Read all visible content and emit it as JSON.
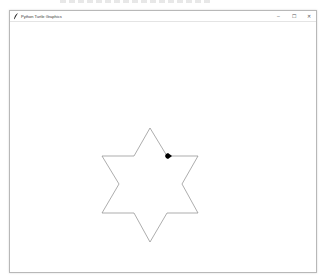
{
  "window": {
    "title": "Python Turtle Graphics",
    "app_icon": "feather-icon",
    "controls": [
      {
        "name": "minimize",
        "glyph": "–"
      },
      {
        "name": "maximize",
        "glyph": "☐"
      },
      {
        "name": "close",
        "glyph": "✕"
      }
    ]
  },
  "drawing": {
    "shape": "six-pointed star",
    "stroke_color": "#8a8a8a",
    "turtle_color": "#000000",
    "turtle_heading": "east"
  }
}
